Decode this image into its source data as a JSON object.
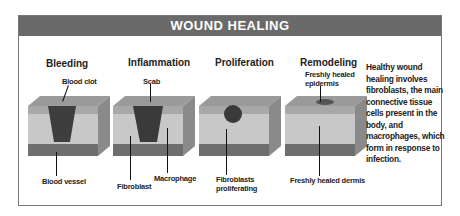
{
  "title": "WOUND HEALING",
  "stages": [
    {
      "name": "Bleeding",
      "labels": {
        "top": "Blood clot",
        "bottom": "Blood vessel"
      }
    },
    {
      "name": "Inflammation",
      "labels": {
        "top": "Scab",
        "bottom_left": "Fibroblast",
        "bottom_right": "Macrophage"
      }
    },
    {
      "name": "Proliferation",
      "labels": {
        "bottom_line1": "Fibroblasts",
        "bottom_line2": "proliferating"
      }
    },
    {
      "name": "Remodeling",
      "labels": {
        "top_line1": "Freshly healed",
        "top_line2": "epidermis",
        "bottom": "Freshly healed dermis"
      }
    }
  ],
  "description": "Healthy wound healing involves fibroblasts, the main connective tissue cells present in the body, and macrophages, which form in response to infection.",
  "colors": {
    "header_bg": "#6a6a6a",
    "header_text": "#ffffff",
    "border": "#777777"
  }
}
